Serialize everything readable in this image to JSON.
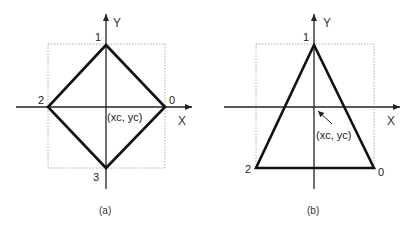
{
  "figure_a": {
    "caption": "(a)",
    "shape": "diamond",
    "x_axis_label": "X",
    "y_axis_label": "Y",
    "center_label": "(xc, yc)",
    "vertex_labels": [
      "0",
      "1",
      "2",
      "3"
    ]
  },
  "figure_b": {
    "caption": "(b)",
    "shape": "triangle",
    "x_axis_label": "X",
    "y_axis_label": "Y",
    "center_label": "(xc, yc)",
    "vertex_labels": [
      "0",
      "1",
      "2"
    ]
  }
}
